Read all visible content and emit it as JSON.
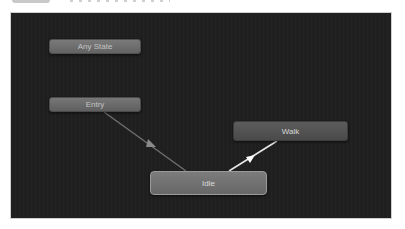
{
  "window": {
    "panel": "Animator state machine graph"
  },
  "graph": {
    "nodes": [
      {
        "id": "any-state",
        "label": "Any State",
        "color": "#6e6e6e"
      },
      {
        "id": "entry",
        "label": "Entry",
        "color": "#6a6a6a"
      },
      {
        "id": "walk",
        "label": "Walk",
        "color": "#525252"
      },
      {
        "id": "idle",
        "label": "Idle",
        "color": "#727272",
        "selected": true
      }
    ],
    "transitions": [
      {
        "from": "Entry",
        "to": "Idle",
        "color": "#6f6f6f"
      },
      {
        "from": "Idle",
        "to": "Walk",
        "color": "#e8e8e8"
      }
    ],
    "background_color": "#1f1f1f"
  }
}
